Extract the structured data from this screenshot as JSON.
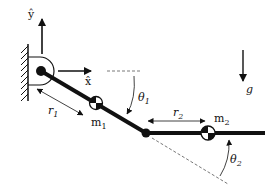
{
  "diagram": {
    "type": "two-link pendulum schematic",
    "colors": {
      "ink": "#111111",
      "background": "#ffffff",
      "dashed": "#555555"
    },
    "labels": {
      "y_axis": "ŷ",
      "x_axis": "x̂",
      "gravity": "g",
      "r1": "r",
      "r1_sub": "1",
      "r2": "r",
      "r2_sub": "2",
      "m1": "m",
      "m1_sub": "1",
      "m2": "m",
      "m2_sub": "2",
      "theta1": "θ",
      "theta1_sub": "1",
      "theta2": "θ",
      "theta2_sub": "2"
    },
    "elements": [
      "wall-hatched-ground",
      "base-pivot",
      "link-1",
      "link-2",
      "elbow-joint",
      "mass-1-centroid",
      "mass-2-centroid",
      "gravity-arrow"
    ]
  }
}
